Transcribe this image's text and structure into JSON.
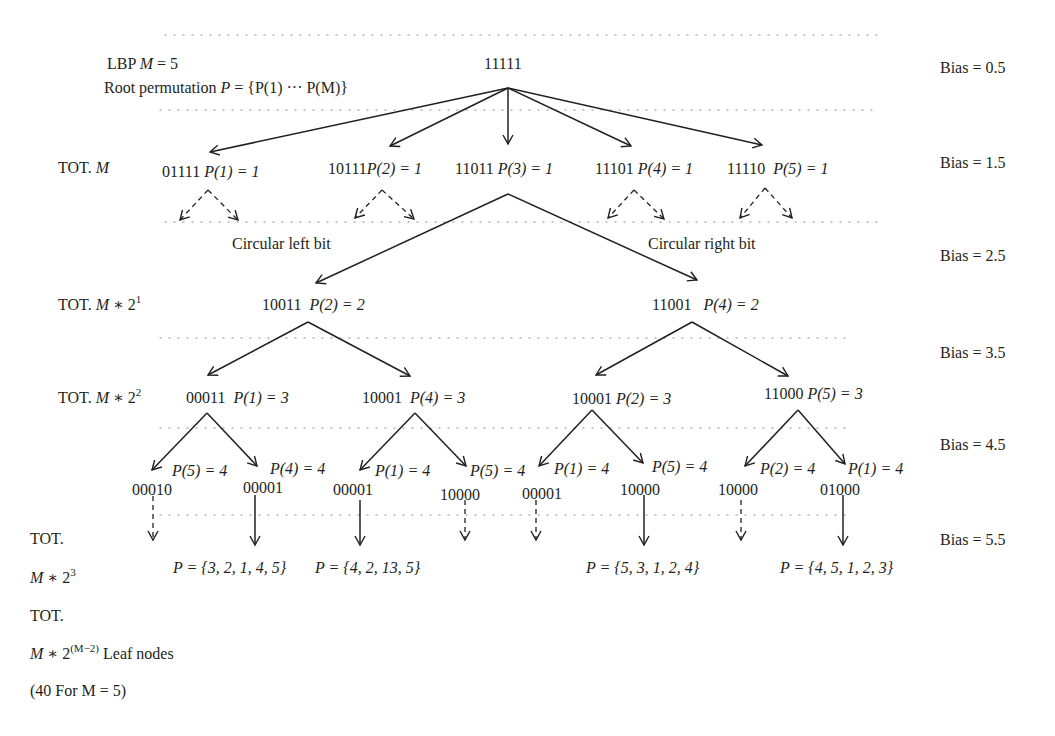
{
  "title": {
    "line1_prefix": "LBP ",
    "line1_var": "M",
    "line1_suffix": " = 5",
    "line2_prefix": "Root permutation ",
    "line2_var": "P",
    "line2_suffix": " = {P(1) ··· P(M)}"
  },
  "root": {
    "code": "11111"
  },
  "bias": [
    "Bias = 0.5",
    "Bias = 1.5",
    "Bias = 2.5",
    "Bias = 3.5",
    "Bias = 4.5",
    "Bias = 5.5"
  ],
  "levels": {
    "l1": "TOT. ",
    "l1_var": "M",
    "l2": "TOT. ",
    "l2_var": "M",
    "l2_op": " ∗ 2",
    "l2_exp": "1",
    "l3": "TOT. ",
    "l3_var": "M",
    "l3_op": " ∗ 2",
    "l3_exp": "2",
    "l4a": "TOT.",
    "l4_var": "M",
    "l4_op": " ∗ 2",
    "l4_exp": "3",
    "l5a": "TOT.",
    "l5_var": "M",
    "l5_op": " ∗ 2",
    "l5_exp": "(M−2)",
    "l5_suffix": " Leaf nodes",
    "l5_note": "(40 For M = 5)"
  },
  "level1_nodes": [
    {
      "code": "01111",
      "perm": "P(1) = 1"
    },
    {
      "code": "10111",
      "perm": "P(2) = 1"
    },
    {
      "code": "11011",
      "perm": "P(3) = 1"
    },
    {
      "code": "11101",
      "perm": "P(4) = 1"
    },
    {
      "code": "11110",
      "perm": "P(5) = 1"
    }
  ],
  "annotations": {
    "left": "Circular left bit",
    "right": "Circular right bit"
  },
  "level2_nodes": [
    {
      "code": "10011",
      "perm": "P(2) = 2"
    },
    {
      "code": "11001",
      "perm": "P(4) = 2"
    }
  ],
  "level3_nodes": [
    {
      "code": "00011",
      "perm": "P(1) = 3"
    },
    {
      "code": "10001",
      "perm": "P(4) = 3"
    },
    {
      "code": "10001",
      "perm": "P(2) = 3"
    },
    {
      "code": "11000",
      "perm": "P(5) = 3"
    }
  ],
  "level4_perms": [
    "P(5) = 4",
    "P(4) = 4",
    "P(1) = 4",
    "P(5) = 4",
    "P(1) = 4",
    "P(5) = 4",
    "P(2) = 4",
    "P(1) = 4"
  ],
  "level4_codes": [
    "00010",
    "00001",
    "00001",
    "10000",
    "00001",
    "10000",
    "10000",
    "01000"
  ],
  "leaf_results": [
    "P = {3, 2, 1, 4, 5}",
    "P = {4, 2, 13, 5}",
    "P = {5, 3, 1, 2, 4}",
    "P = {4, 5, 1, 2, 3}"
  ]
}
